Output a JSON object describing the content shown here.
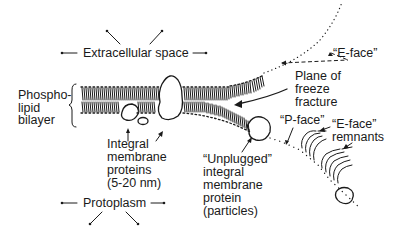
{
  "diagram": {
    "labels": {
      "extracellular": "Extracellular space",
      "protoplasm": "Protoplasm",
      "bilayer_line1": "Phospho-",
      "bilayer_line2": "lipid",
      "bilayer_line3": "bilayer",
      "eface": "“E-face”",
      "plane_line1": "Plane of",
      "plane_line2": "freeze",
      "plane_line3": "fracture",
      "pface": "“P-face”",
      "remnants_line1": "“E-face”",
      "remnants_line2": "remnants",
      "integral_line1": "Integral",
      "integral_line2": "membrane",
      "integral_line3": "proteins",
      "integral_line4": "(5-20 nm)",
      "unplugged_line1": "“Unplugged”",
      "unplugged_line2": "integral",
      "unplugged_line3": "membrane",
      "unplugged_line4": "protein",
      "unplugged_line5": "(particles)"
    },
    "colors": {
      "ink": "#1a1a1a",
      "background": "#ffffff"
    }
  }
}
